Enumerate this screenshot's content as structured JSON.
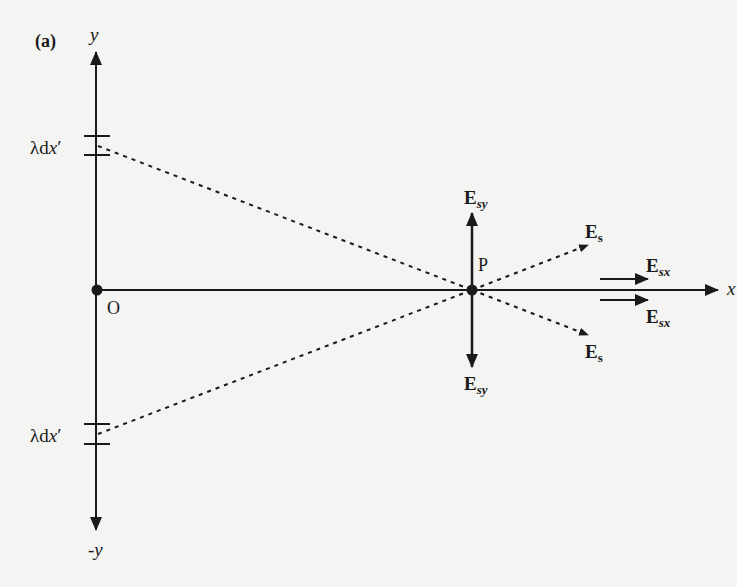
{
  "panel_label": "(a)",
  "axes": {
    "y_pos_label": "y",
    "y_neg_label": "-y",
    "x_label": "x",
    "origin_label": "O"
  },
  "point": {
    "label": "P"
  },
  "charge_elements": {
    "upper": {
      "lambda": "λ",
      "d": "d",
      "x": "x",
      "prime": "′"
    },
    "lower": {
      "lambda": "λ",
      "d": "d",
      "x": "x",
      "prime": "′"
    }
  },
  "vectors": {
    "esy_up": {
      "main": "E",
      "sub": "sy"
    },
    "esy_down": {
      "main": "E",
      "sub": "sy"
    },
    "es_up": {
      "main": "E",
      "sub": "s"
    },
    "es_down": {
      "main": "E",
      "sub": "s"
    },
    "esx_up": {
      "main": "E",
      "sub": "sx"
    },
    "esx_down": {
      "main": "E",
      "sub": "sx"
    }
  },
  "colors": {
    "ink": "#1a1a1a",
    "background": "#f4f4f2"
  }
}
